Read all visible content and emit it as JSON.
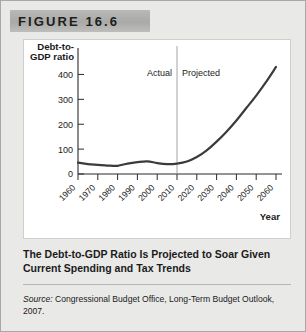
{
  "figure": {
    "banner_label": "FIGURE 16.6",
    "caption": "The Debt-to-GDP Ratio Is Projected to Soar Given Current Spending and Tax Trends",
    "source_prefix": "Source:",
    "source_text": "Congressional Budget Office, Long-Term Budget Outlook, 2007."
  },
  "chart_data": {
    "type": "line",
    "title": "",
    "xlabel": "Year",
    "ylabel": "Debt-to-GDP ratio",
    "ylabel_line1": "Debt-to-",
    "ylabel_line2": "GDP ratio",
    "xlim": [
      1960,
      2060
    ],
    "ylim": [
      0,
      450
    ],
    "yticks": [
      0,
      100,
      200,
      300,
      400
    ],
    "ytick_labels": [
      "0",
      "100",
      "200",
      "300",
      "400"
    ],
    "xticks": [
      1960,
      1970,
      1980,
      1990,
      2000,
      2010,
      2020,
      2030,
      2040,
      2050,
      2060
    ],
    "xtick_labels": [
      "1960",
      "1970",
      "1980",
      "1990",
      "2000",
      "2010",
      "2020",
      "2030",
      "2040",
      "2050",
      "2060"
    ],
    "grid": false,
    "legend": "none",
    "annotations": [
      {
        "name": "actual-label",
        "text": "Actual",
        "x": 1997,
        "y": 395
      },
      {
        "name": "projected-label",
        "text": "Projected",
        "x": 2023,
        "y": 395
      },
      {
        "name": "divider-line",
        "text": "",
        "x": 2010,
        "y": 0
      }
    ],
    "divider_year": 2010,
    "series": [
      {
        "name": "Debt-to-GDP ratio",
        "color": "#3b3b3b",
        "x": [
          1960,
          1965,
          1970,
          1975,
          1980,
          1985,
          1990,
          1995,
          2000,
          2005,
          2010,
          2015,
          2020,
          2025,
          2030,
          2035,
          2040,
          2045,
          2050,
          2055,
          2060
        ],
        "values": [
          46,
          40,
          37,
          34,
          33,
          42,
          48,
          51,
          44,
          40,
          42,
          50,
          68,
          95,
          130,
          170,
          215,
          265,
          315,
          370,
          430
        ]
      }
    ]
  }
}
